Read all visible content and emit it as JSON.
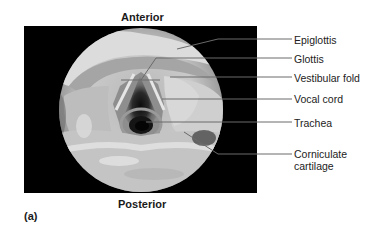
{
  "figure": {
    "top_label": "Anterior",
    "bottom_label": "Posterior",
    "panel_label": "(a)",
    "photo_description": "Laryngoscopic view of the larynx (grayscale endoscopic photo)"
  },
  "labels": [
    {
      "id": "epiglottis",
      "text": "Epiglottis",
      "y": 34
    },
    {
      "id": "glottis",
      "text": "Glottis",
      "y": 53
    },
    {
      "id": "vestibular-fold",
      "text": "Vestibular fold",
      "y": 73
    },
    {
      "id": "vocal-cord",
      "text": "Vocal cord",
      "y": 94
    },
    {
      "id": "trachea",
      "text": "Trachea",
      "y": 118
    },
    {
      "id": "corniculate-cartilage-1",
      "text": "Corniculate",
      "y": 148
    },
    {
      "id": "corniculate-cartilage-2",
      "text": "cartilage",
      "y": 160
    }
  ],
  "colors": {
    "background": "#ffffff",
    "photo_frame": "#000000",
    "leader_line": "#6a6a6a",
    "text": "#1a1a1a"
  }
}
